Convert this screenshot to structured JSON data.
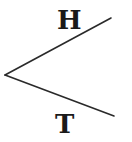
{
  "tree": {
    "root": {
      "x": 5,
      "y": 75
    },
    "branches": [
      {
        "id": "heads",
        "label": "H",
        "end": {
          "x": 111,
          "y": 18
        }
      },
      {
        "id": "tails",
        "label": "T",
        "end": {
          "x": 114,
          "y": 116
        }
      }
    ],
    "line_color": "#2a2a2a",
    "text_color": "#1a1a1a"
  }
}
